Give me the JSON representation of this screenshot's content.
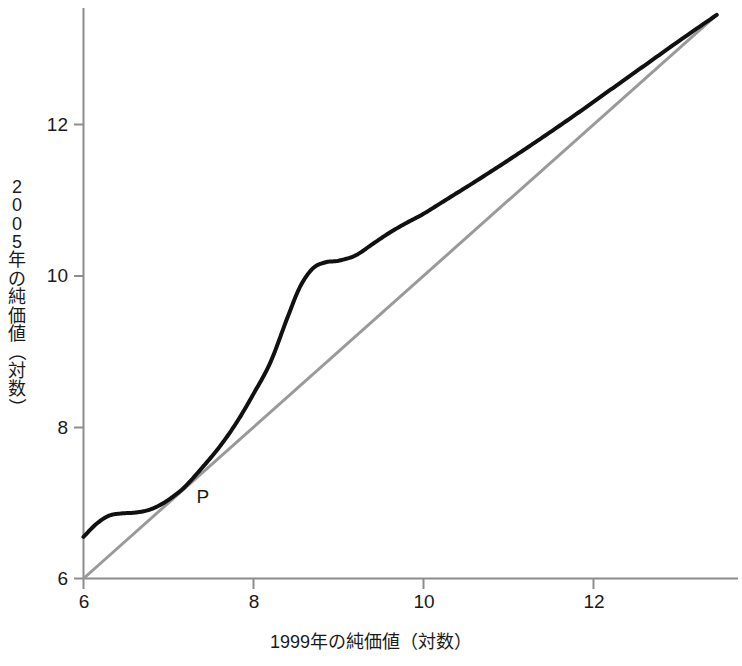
{
  "chart_data": {
    "type": "line",
    "title": "",
    "xlabel": "1999年の純価値（対数）",
    "ylabel": "2005年の純価値（対数）",
    "xlim": [
      6,
      13.45
    ],
    "ylim": [
      6,
      13.45
    ],
    "xticks": [
      6,
      8,
      10,
      12
    ],
    "yticks": [
      6,
      8,
      10,
      12
    ],
    "xtick_labels": [
      "6",
      "8",
      "10",
      "12"
    ],
    "ytick_labels": [
      "6",
      "8",
      "10",
      "12"
    ],
    "grid": false,
    "legend": "none",
    "series": [
      {
        "name": "nonparametric-regression-curve",
        "style": "solid",
        "color": "#111111",
        "width_px": 4,
        "x": [
          6.0,
          6.15,
          6.3,
          6.45,
          6.6,
          6.75,
          6.9,
          7.05,
          7.2,
          7.4,
          7.6,
          7.8,
          8.0,
          8.2,
          8.4,
          8.55,
          8.7,
          8.85,
          9.0,
          9.2,
          9.4,
          9.6,
          9.8,
          10.0,
          10.3,
          10.6,
          11.0,
          11.4,
          11.8,
          12.2,
          12.6,
          13.0,
          13.45
        ],
        "y": [
          6.55,
          6.72,
          6.83,
          6.86,
          6.87,
          6.9,
          6.97,
          7.08,
          7.22,
          7.47,
          7.74,
          8.06,
          8.44,
          8.86,
          9.45,
          9.86,
          10.1,
          10.18,
          10.2,
          10.27,
          10.42,
          10.57,
          10.7,
          10.82,
          11.03,
          11.24,
          11.53,
          11.83,
          12.14,
          12.46,
          12.78,
          13.1,
          13.45
        ]
      },
      {
        "name": "identity-reference-line",
        "style": "solid",
        "color": "#9a9a9a",
        "width_px": 3,
        "x": [
          6,
          13.45
        ],
        "y": [
          6,
          13.45
        ]
      }
    ],
    "annotations": [
      {
        "text": "P",
        "x": 7.4,
        "y": 7.05,
        "name": "curve-label-p"
      }
    ]
  },
  "axes": {
    "y_label_chars": [
      "2",
      "0",
      "0",
      "5",
      "年",
      "の",
      "純",
      "価",
      "値",
      "（",
      "対",
      "数",
      "）"
    ]
  }
}
